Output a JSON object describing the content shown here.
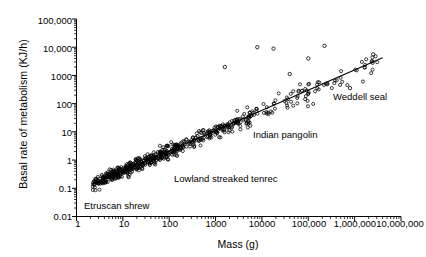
{
  "chart_data": {
    "type": "scatter",
    "title": "",
    "xlabel": "Mass (g)",
    "ylabel": "Basal rate of metabolism (KJ/h)",
    "xscale": "log",
    "yscale": "log",
    "xlim": [
      1,
      10000000
    ],
    "ylim": [
      0.01,
      100000
    ],
    "grid": false,
    "legend": "none",
    "xticks": [
      "1",
      "10",
      "100",
      "1000",
      "10000",
      "100,000",
      "1,000,000",
      "10,000,000"
    ],
    "xtick_values": [
      1,
      10,
      100,
      1000,
      10000,
      100000,
      1000000,
      10000000
    ],
    "yticks": [
      "0.01",
      "0.1",
      "1",
      "10",
      "100",
      "1000",
      "10,000",
      "100,000"
    ],
    "ytick_values": [
      0.01,
      0.1,
      1,
      10,
      100,
      1000,
      10000,
      100000
    ],
    "marker": "open-circle",
    "marker_color": "#000000",
    "n_points": 612,
    "regression_line": {
      "label": "allometric fit",
      "color": "#000000",
      "x_start": 2.2,
      "y_start": 0.14,
      "x_end": 4000000,
      "y_end": 4200,
      "slope_log": 0.71,
      "intercept_log": -1.1
    },
    "annotations": [
      {
        "label": "Weddell seal",
        "x_px": 333,
        "y_px": 92,
        "point_mass": 400000,
        "point_bmr": 2600
      },
      {
        "label": "Indian pangolin",
        "x_px": 253,
        "y_px": 130,
        "point_mass": 5000,
        "point_bmr": 28
      },
      {
        "label": "Lowland streaked tenrec",
        "x_px": 174,
        "y_px": 174,
        "point_mass": 150,
        "point_bmr": 1.2
      },
      {
        "label": "Etruscan shrew",
        "x_px": 84,
        "y_px": 201,
        "point_mass": 2.5,
        "point_bmr": 0.18
      }
    ],
    "series": [
      {
        "name": "mammals",
        "note": "Basal metabolic rate scales with body mass on log-log axes; dense band of open circles from small shrews (~2 g) to large marine mammals (~4,000,000 g)."
      }
    ]
  },
  "axes": {
    "ylabel": "Basal rate of metabolism (KJ/h)",
    "xlabel": "Mass (g)"
  }
}
